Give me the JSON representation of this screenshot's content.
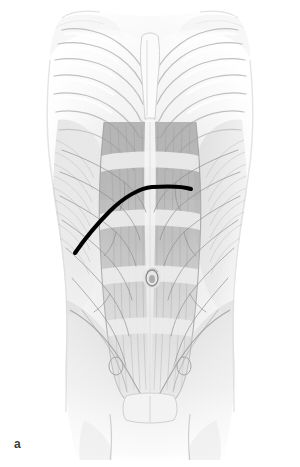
{
  "figure": {
    "label": "a",
    "caption_letter": "a",
    "view": "anterior",
    "modality": "anatomical-illustration-grayscale",
    "width_px": 300,
    "height_px": 467
  },
  "colors": {
    "background": "#ffffff",
    "incision_line": "#000000",
    "label_text": "#3b3b3b",
    "skin_outline": "#e9e9e9",
    "bone_light": "#f4f4f4",
    "bone_edge": "#b8b8b8",
    "muscle_mid": "#bdbdbd",
    "muscle_dark": "#9a9a9a",
    "muscle_light": "#d8d8d8",
    "vessel": "#8f8f8f",
    "tendon": "#ededed"
  },
  "annotations": {
    "incision": {
      "name": "subcostal incision marking",
      "style": "solid bold curve",
      "stroke_width_px": 4,
      "start_point": [
        75,
        253
      ],
      "peak_point": [
        152,
        187
      ],
      "end_point": [
        191,
        189
      ]
    }
  },
  "structures": {
    "ribcage": {
      "label": "ribcage",
      "rib_pairs": 7,
      "side_left_x": 60,
      "side_right_x": 242
    },
    "sternum": {
      "label": "sternum",
      "center_x": 150,
      "top_y": 38,
      "bottom_y": 120
    },
    "umbilicus": {
      "label": "umbilicus",
      "cx": 152,
      "cy": 278,
      "rx": 6,
      "ry": 8
    },
    "linea_alba": {
      "label": "linea alba",
      "x": 150,
      "top_y": 120,
      "bottom_y": 400
    },
    "rectus_abdominis": {
      "label": "rectus abdominis",
      "tendinous_intersections": 4
    },
    "pubic_symphysis": {
      "label": "pubic symphysis",
      "cx": 150,
      "cy": 404
    }
  }
}
